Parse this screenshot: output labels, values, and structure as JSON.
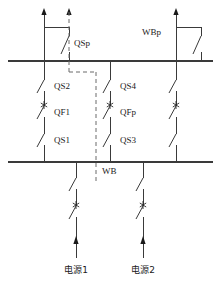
{
  "diagram": {
    "title": "",
    "type": "electrical-single-line-diagram",
    "colors": {
      "wire": "#3a3a3a",
      "dashed": "#6a6a6a",
      "text": "#1a1a1a",
      "background": "#ffffff"
    },
    "labels": {
      "qsp": "QSp",
      "wbp": "WBp",
      "qs2": "QS2",
      "qf1": "QF1",
      "qs1": "QS1",
      "qs4": "QS4",
      "qfp": "QFp",
      "qs3": "QS3",
      "wb": "WB",
      "source1": "电源1",
      "source2": "电源2"
    },
    "buses": [
      {
        "name": "upper-bus-wbp",
        "label": "WBp",
        "y": 61
      },
      {
        "name": "lower-bus-wb",
        "label": "WB",
        "y": 162
      }
    ],
    "feeders": [
      {
        "name": "feeder-left",
        "x": 44,
        "switches": [
          "QS2",
          "QF1",
          "QS1"
        ]
      },
      {
        "name": "feeder-middle",
        "x": 110,
        "switches": [
          "QS4",
          "QFp",
          "QS3"
        ]
      },
      {
        "name": "feeder-right",
        "x": 176,
        "switches": [
          "",
          "",
          ""
        ]
      }
    ],
    "sources": [
      {
        "name": "source-1",
        "label": "电源1",
        "x": 76
      },
      {
        "name": "source-2",
        "label": "电源2",
        "x": 143
      }
    ]
  }
}
